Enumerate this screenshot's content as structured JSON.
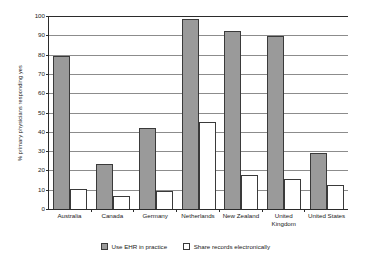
{
  "chart_data": {
    "type": "bar",
    "title": "",
    "xlabel": "",
    "ylabel": "% primary physicians responding yes",
    "ylim": [
      0,
      100
    ],
    "yticks": [
      0,
      10,
      20,
      30,
      40,
      50,
      60,
      70,
      80,
      90,
      100
    ],
    "grid": true,
    "legend_position": "bottom-center",
    "categories": [
      "Australia",
      "Canada",
      "Germany",
      "Netherlands",
      "New Zealand",
      "United Kingdom",
      "United States"
    ],
    "series": [
      {
        "name": "Use EHR in practice",
        "color": "#9a9a9a",
        "values": [
          79,
          23,
          42,
          98,
          92,
          89,
          29
        ]
      },
      {
        "name": "Share records electronically",
        "color": "#ffffff",
        "values": [
          10.5,
          6.5,
          9.5,
          45,
          17.5,
          15.5,
          12.5
        ]
      }
    ]
  }
}
